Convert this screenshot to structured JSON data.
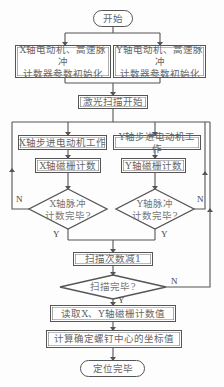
{
  "flowchart": {
    "start": "开始",
    "init_x_line1": "X轴电动机、高速脉冲",
    "init_x_line2": "计数器参数初始化",
    "init_y_line1": "Y轴电动机、高速脉冲",
    "init_y_line2": "计数器参数初始化",
    "laser_scan_start": "激光扫描开始",
    "x_stepper": "X轴步进电动机工作",
    "y_stepper": "Y轴步进电动机工作",
    "x_grating": "X轴磁栅计数",
    "y_grating": "Y轴磁栅计数",
    "x_decision_line1": "X轴脉冲",
    "x_decision_line2": "计数完毕?",
    "y_decision_line1": "Y轴脉冲",
    "y_decision_line2": "计数完毕?",
    "scan_count_decrement": "扫描次数减1",
    "scan_done_decision": "扫描完毕?",
    "read_counts": "读取X、Y轴磁栅计数值",
    "compute_center": "计算确定螺钉中心的坐标值",
    "end": "定位完毕",
    "label_yes": "Y",
    "label_no": "N"
  },
  "colors": {
    "line": "#555555",
    "text": "#666666"
  }
}
